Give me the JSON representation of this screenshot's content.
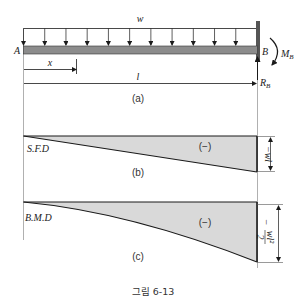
{
  "figure": {
    "caption": "그림 6-13",
    "colors": {
      "line": "#1a1a1a",
      "beam_fill": "#8c8c8c",
      "area_fill": "#d9d9d9",
      "wall": "#555555",
      "guide": "#b0b0b0"
    },
    "panel_a": {
      "label": "(a)",
      "load_label": "w",
      "end_left_label": "A",
      "end_right_label": "B",
      "moment_label": "M",
      "moment_sub": "B",
      "reaction_label": "R",
      "reaction_sub": "B",
      "dim_x_label": "x",
      "dim_l_label": "l",
      "load_arrow_count": 12
    },
    "panel_b": {
      "label": "(b)",
      "title": "S.F.D",
      "sign": "(−)",
      "magnitude": "−wl",
      "shape": "linear"
    },
    "panel_c": {
      "label": "(c)",
      "title": "B.M.D",
      "sign": "(−)",
      "magnitude_prefix": "−",
      "magnitude_num": "wl²",
      "magnitude_den": "2",
      "shape": "parabolic"
    }
  }
}
